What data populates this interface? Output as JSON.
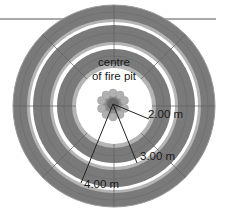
{
  "diagram": {
    "type": "concentric-seating-rings-plan",
    "center_label": [
      "centre",
      "of fire pit"
    ],
    "radius_labels": [
      {
        "id": "r2",
        "text": "2.00 m"
      },
      {
        "id": "r3",
        "text": "3.00 m"
      },
      {
        "id": "r4",
        "text": "4.00 m"
      }
    ],
    "ring_count": 3,
    "colors": {
      "ring_fill": "#7a7a7a",
      "ring_edge_light": "#b4b4b4",
      "plank_line": "#5e5e5e",
      "gap": "#ffffff",
      "stone": "#b0b0b0",
      "pit_center": "#6a6a6a",
      "line": "#222222",
      "ground_line": "#555555"
    }
  }
}
